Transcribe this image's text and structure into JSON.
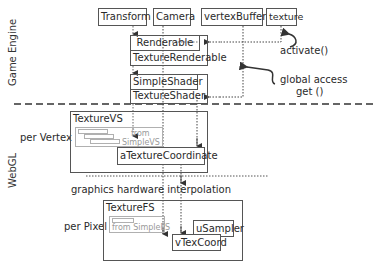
{
  "regions": {
    "game_engine": "Game Engine",
    "webgl": "WebGL",
    "per_vertex": "per Vertex",
    "per_pixel": "per Pixel"
  },
  "top_boxes": {
    "transform": "Transform",
    "camera": "Camera",
    "vertex_buffer": "vertexBuffer",
    "texture": "texture"
  },
  "renderables": {
    "renderable": "Renderable",
    "texture_renderable": "TextureRenderable"
  },
  "shaders": {
    "simple_shader": "SimpleShader",
    "texture_shader": "TextureShader"
  },
  "vertex_shader": {
    "title": "TextureVS",
    "from_line1": "from",
    "from_line2": "SimpleVS",
    "attribute": "aTextureCoordinate"
  },
  "fragment_shader": {
    "title": "TextureFS",
    "from": "from SimpleFS",
    "sampler": "uSampler",
    "varying": "vTexCoord"
  },
  "annotations": {
    "activate": "activate()",
    "global_access_line1": "global access",
    "global_access_line2": "get ()",
    "interpolation": "graphics hardware interpolation"
  }
}
